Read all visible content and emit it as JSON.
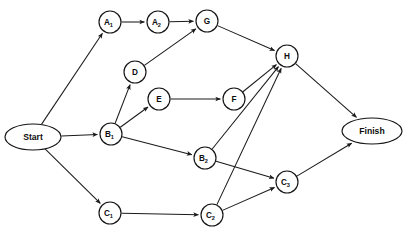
{
  "diagram": {
    "type": "directed-acyclic-graph",
    "canvas": {
      "width": 409,
      "height": 245
    },
    "style": {
      "background_color": "#ffffff",
      "node_fill": "#ffffff",
      "node_stroke": "#141414",
      "edge_color": "#1a1a1a",
      "label_color": "#0d0d0d"
    },
    "nodes": [
      {
        "id": "start",
        "label": "Start",
        "sub": "",
        "shape": "ellipse",
        "cx": 33,
        "cy": 137,
        "rx": 28,
        "ry": 13,
        "kind": "terminal"
      },
      {
        "id": "a1",
        "label": "A",
        "sub": "1",
        "shape": "circle",
        "cx": 110,
        "cy": 22,
        "rx": 11,
        "ry": 11,
        "kind": "activity"
      },
      {
        "id": "a2",
        "label": "A",
        "sub": "2",
        "shape": "circle",
        "cx": 158,
        "cy": 22,
        "rx": 11,
        "ry": 11,
        "kind": "activity"
      },
      {
        "id": "g",
        "label": "G",
        "sub": "",
        "shape": "circle",
        "cx": 207,
        "cy": 21,
        "rx": 11,
        "ry": 11,
        "kind": "activity"
      },
      {
        "id": "d",
        "label": "D",
        "sub": "",
        "shape": "circle",
        "cx": 135,
        "cy": 72,
        "rx": 11,
        "ry": 11,
        "kind": "activity"
      },
      {
        "id": "e",
        "label": "E",
        "sub": "",
        "shape": "circle",
        "cx": 159,
        "cy": 99,
        "rx": 11,
        "ry": 11,
        "kind": "activity"
      },
      {
        "id": "f",
        "label": "F",
        "sub": "",
        "shape": "circle",
        "cx": 234,
        "cy": 99,
        "rx": 11,
        "ry": 11,
        "kind": "activity"
      },
      {
        "id": "h",
        "label": "H",
        "sub": "",
        "shape": "circle",
        "cx": 287,
        "cy": 56,
        "rx": 11,
        "ry": 11,
        "kind": "activity"
      },
      {
        "id": "b1",
        "label": "B",
        "sub": "1",
        "shape": "circle",
        "cx": 111,
        "cy": 134,
        "rx": 11,
        "ry": 11,
        "kind": "activity"
      },
      {
        "id": "b2",
        "label": "B",
        "sub": "2",
        "shape": "circle",
        "cx": 205,
        "cy": 158,
        "rx": 11,
        "ry": 11,
        "kind": "activity"
      },
      {
        "id": "c1",
        "label": "C",
        "sub": "1",
        "shape": "circle",
        "cx": 110,
        "cy": 213,
        "rx": 11,
        "ry": 11,
        "kind": "activity"
      },
      {
        "id": "c2",
        "label": "C",
        "sub": "2",
        "shape": "circle",
        "cx": 212,
        "cy": 215,
        "rx": 11,
        "ry": 11,
        "kind": "activity"
      },
      {
        "id": "c3",
        "label": "C",
        "sub": "3",
        "shape": "circle",
        "cx": 287,
        "cy": 182,
        "rx": 11,
        "ry": 11,
        "kind": "activity"
      },
      {
        "id": "finish",
        "label": "Finish",
        "sub": "",
        "shape": "ellipse",
        "cx": 372,
        "cy": 131,
        "rx": 30,
        "ry": 13,
        "kind": "terminal"
      }
    ],
    "edges": [
      {
        "from": "start",
        "to": "a1",
        "label": ""
      },
      {
        "from": "start",
        "to": "b1",
        "label": ""
      },
      {
        "from": "start",
        "to": "c1",
        "label": ""
      },
      {
        "from": "a1",
        "to": "a2",
        "label": ""
      },
      {
        "from": "a2",
        "to": "g",
        "label": ""
      },
      {
        "from": "d",
        "to": "g",
        "label": ""
      },
      {
        "from": "g",
        "to": "h",
        "label": ""
      },
      {
        "from": "b1",
        "to": "d",
        "label": ""
      },
      {
        "from": "b1",
        "to": "e",
        "label": ""
      },
      {
        "from": "b1",
        "to": "b2",
        "label": ""
      },
      {
        "from": "e",
        "to": "f",
        "label": ""
      },
      {
        "from": "f",
        "to": "h",
        "label": ""
      },
      {
        "from": "b2",
        "to": "h",
        "label": ""
      },
      {
        "from": "b2",
        "to": "c3",
        "label": ""
      },
      {
        "from": "c1",
        "to": "c2",
        "label": ""
      },
      {
        "from": "c2",
        "to": "h",
        "label": ""
      },
      {
        "from": "c2",
        "to": "c3",
        "label": ""
      },
      {
        "from": "c3",
        "to": "finish",
        "label": ""
      },
      {
        "from": "h",
        "to": "finish",
        "label": ""
      }
    ]
  }
}
